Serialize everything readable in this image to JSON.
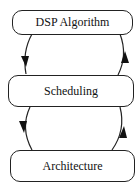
{
  "diagram": {
    "nodes": [
      {
        "id": "dsp",
        "label": "DSP Algorithm"
      },
      {
        "id": "sched",
        "label": "Scheduling"
      },
      {
        "id": "arch",
        "label": "Architecture"
      }
    ],
    "edges": [
      {
        "from": "DSP Algorithm",
        "to": "Scheduling",
        "side": "left"
      },
      {
        "from": "Scheduling",
        "to": "DSP Algorithm",
        "side": "right"
      },
      {
        "from": "Scheduling",
        "to": "Architecture",
        "side": "left"
      },
      {
        "from": "Architecture",
        "to": "Scheduling",
        "side": "right"
      }
    ],
    "colors": {
      "stroke": "#222222",
      "background": "#ffffff"
    }
  }
}
